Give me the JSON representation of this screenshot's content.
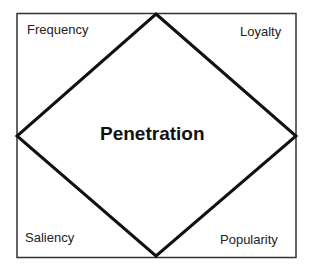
{
  "diagram": {
    "center_label": "Penetration",
    "corners": {
      "top_left": "Frequency",
      "top_right": "Loyalty",
      "bottom_left": "Saliency",
      "bottom_right": "Popularity"
    },
    "colors": {
      "line": "#111111",
      "frame": "#333333",
      "background": "#ffffff"
    }
  }
}
